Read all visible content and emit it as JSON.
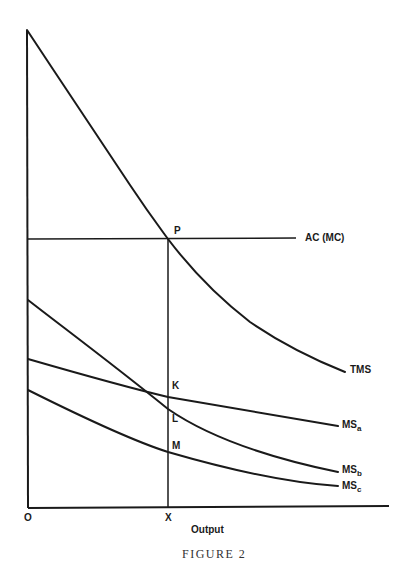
{
  "figure": {
    "caption": "FIGURE 2",
    "x_axis_label": "Output",
    "origin_label": "O",
    "x_point_label": "X"
  },
  "curves": {
    "tms": {
      "label": "TMS"
    },
    "ac": {
      "label": "AC (MC)"
    },
    "msa": {
      "label": "MS",
      "sub": "a"
    },
    "msb": {
      "label": "MS",
      "sub": "b"
    },
    "msc": {
      "label": "MS",
      "sub": "c"
    }
  },
  "points": {
    "p": "P",
    "k": "K",
    "l": "L",
    "m": "M"
  },
  "colors": {
    "ink": "#1a1a1a",
    "background": "#ffffff"
  }
}
